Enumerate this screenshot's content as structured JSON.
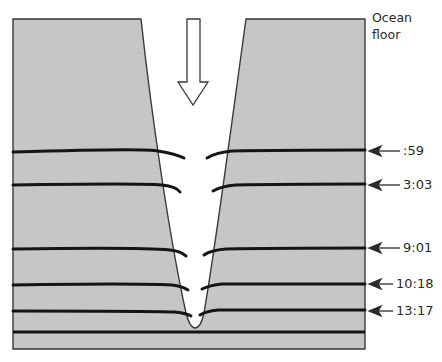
{
  "diagram": {
    "title_line1": "Ocean",
    "title_line2": "floor",
    "colors": {
      "rock": "#c6c6c6",
      "outline": "#3a3a3a",
      "layer_line": "#151515",
      "label": "#2a2a2a",
      "background": "#ffffff"
    },
    "down_arrow": "hollow-down-arrow",
    "layers": [
      {
        "label": ":59",
        "y": 151
      },
      {
        "label": "3:03",
        "y": 185
      },
      {
        "label": "9:01",
        "y": 248
      },
      {
        "label": "10:18",
        "y": 284
      },
      {
        "label": "13:17",
        "y": 311
      }
    ],
    "bottom_layer_y": 332
  }
}
